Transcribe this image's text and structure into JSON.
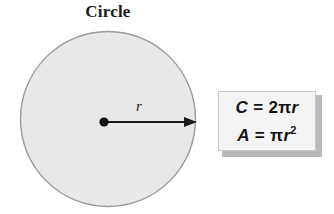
{
  "figure": {
    "title": "Circle",
    "shape_name": "circle",
    "radius_label": "r",
    "center_point_label": "center-dot",
    "radius_arrow_label": "radius-arrow"
  },
  "formulas": {
    "circumference": {
      "lhs": "C",
      "equals": "=",
      "coefficient": "2",
      "pi": "π",
      "variable": "r",
      "full": "C = 2πr"
    },
    "area": {
      "lhs": "A",
      "equals": "=",
      "pi": "π",
      "variable": "r",
      "exponent": "2",
      "full": "A = πr²"
    }
  },
  "colors": {
    "page_background": "#ffffff",
    "circle_fill": "#e8e8e8",
    "circle_stroke": "#9a9a9a",
    "center_dot": "#111111",
    "arrow": "#1a1a1a",
    "text": "#1a1a1a",
    "box_fill": "#f4f4f4",
    "box_border": "#c8c8c8",
    "box_shadow": "#b9b9b9"
  },
  "geometry": {
    "circle_center_x": 108,
    "circle_center_y": 119,
    "circle_radius": 88,
    "dot_x": 104,
    "dot_y": 122,
    "arrow_tip_x": 197,
    "arrow_y": 122
  }
}
